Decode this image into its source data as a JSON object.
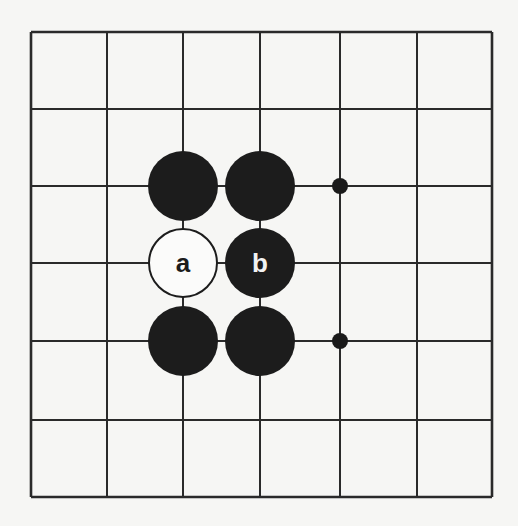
{
  "diagram": {
    "type": "go-board-fragment",
    "grid": {
      "columns": 7,
      "rows": 7,
      "x_lines": [
        31,
        107,
        183,
        260,
        340,
        417,
        492
      ],
      "y_lines": [
        32,
        109,
        186,
        263,
        341,
        420,
        497
      ],
      "line_color": "#2a2a2a",
      "background": "#f6f6f4"
    },
    "stones": [
      {
        "col": 2,
        "row": 2,
        "color": "black",
        "label": ""
      },
      {
        "col": 3,
        "row": 2,
        "color": "black",
        "label": ""
      },
      {
        "col": 2,
        "row": 3,
        "color": "white",
        "label": "a"
      },
      {
        "col": 3,
        "row": 3,
        "color": "black",
        "label": "b"
      },
      {
        "col": 2,
        "row": 4,
        "color": "black",
        "label": ""
      },
      {
        "col": 3,
        "row": 4,
        "color": "black",
        "label": ""
      }
    ],
    "markers": [
      {
        "col": 4,
        "row": 2,
        "type": "dot"
      },
      {
        "col": 4,
        "row": 4,
        "type": "dot"
      }
    ],
    "stone_radius": 35,
    "marker_radius": 8
  }
}
